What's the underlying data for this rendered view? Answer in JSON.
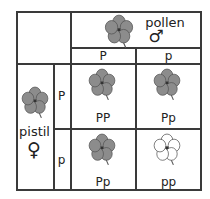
{
  "diagram": {
    "type": "punnett-square",
    "header": {
      "pollen_label": "pollen",
      "male_symbol": "♂",
      "columns": [
        "P",
        "p"
      ]
    },
    "side": {
      "pistil_label": "pistil",
      "female_symbol": "♀",
      "rows": [
        "P",
        "p"
      ]
    },
    "cells": [
      {
        "genotype": "PP",
        "flower": "purple"
      },
      {
        "genotype": "Pp",
        "flower": "purple"
      },
      {
        "genotype": "Pp",
        "flower": "purple"
      },
      {
        "genotype": "pp",
        "flower": "white"
      }
    ],
    "colors": {
      "purple_flower_fill": "#8c8c8c",
      "white_flower_fill": "#ffffff",
      "outline": "#555555",
      "grid": "#3a3a3a"
    }
  }
}
